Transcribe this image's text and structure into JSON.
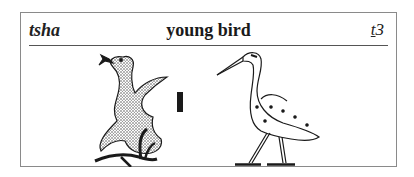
{
  "entry": {
    "transliteration": "tsha",
    "meaning": "young bird",
    "code_underlined": "t",
    "code_rest": "3"
  },
  "glyphs": [
    {
      "name": "duckling-flapping-wings",
      "description": "stippled young bird with spread wings beside a plant"
    },
    {
      "name": "stroke",
      "description": "single vertical stroke determinative"
    },
    {
      "name": "heron",
      "description": "standing wading bird with dotted wing"
    }
  ],
  "colors": {
    "ink": "#1a1a1a",
    "border": "#8a8a8a",
    "background": "#ffffff"
  }
}
